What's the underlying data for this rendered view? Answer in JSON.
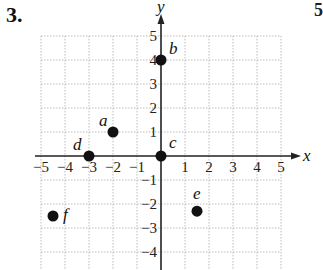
{
  "problem_number": "3.",
  "edge_glyph": "5",
  "chart_data": {
    "type": "scatter",
    "title": "",
    "xlabel": "x",
    "ylabel": "y",
    "xlim": [
      -5,
      5
    ],
    "ylim": [
      -5,
      5
    ],
    "grid": true,
    "x_ticks": [
      "-5",
      "-4",
      "-3",
      "-2",
      "-1",
      "1",
      "2",
      "3",
      "4",
      "5"
    ],
    "y_ticks": [
      "5",
      "4",
      "3",
      "2",
      "1",
      "-1",
      "-2",
      "-3",
      "-4"
    ],
    "points": [
      {
        "label": "a",
        "x": -2,
        "y": 1
      },
      {
        "label": "b",
        "x": 0,
        "y": 4
      },
      {
        "label": "c",
        "x": 0,
        "y": 0
      },
      {
        "label": "d",
        "x": -3,
        "y": 0
      },
      {
        "label": "e",
        "x": 1.5,
        "y": -2.3
      },
      {
        "label": "f",
        "x": -4.5,
        "y": -2.5
      }
    ]
  }
}
